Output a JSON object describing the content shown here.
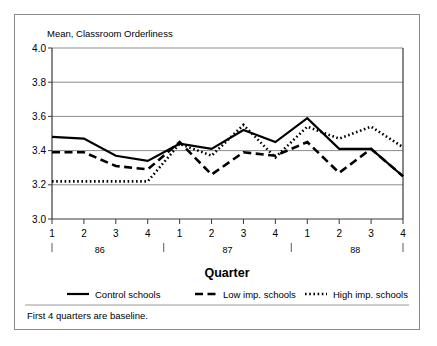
{
  "figure": {
    "plot_title": "Mean, Classroom Orderliness",
    "footnote": "First 4 quarters are baseline."
  },
  "chart_data": {
    "type": "line",
    "title": "Mean, Classroom Orderliness",
    "xlabel": "Quarter",
    "ylabel": "Mean, Classroom Orderliness",
    "ylim": [
      3.0,
      4.0
    ],
    "ytick_labels": [
      "4.0",
      "3.8",
      "3.6",
      "3.4",
      "3.2",
      "3.0"
    ],
    "ytick_values": [
      4.0,
      3.8,
      3.6,
      3.4,
      3.2,
      3.0
    ],
    "grid": true,
    "legend_position": "bottom",
    "categories": [
      "1",
      "2",
      "3",
      "4",
      "1",
      "2",
      "3",
      "4",
      "1",
      "2",
      "3",
      "4"
    ],
    "x_groups": [
      {
        "label": "86",
        "quarters": [
          "1",
          "2",
          "3",
          "4"
        ]
      },
      {
        "label": "87",
        "quarters": [
          "1",
          "2",
          "3",
          "4"
        ]
      },
      {
        "label": "88",
        "quarters": [
          "1",
          "2",
          "3",
          "4"
        ]
      }
    ],
    "annotations": [
      "First 4 quarters are baseline."
    ],
    "series": [
      {
        "name": "Control schools",
        "style": "solid",
        "values": [
          3.48,
          3.47,
          3.37,
          3.34,
          3.44,
          3.41,
          3.52,
          3.45,
          3.59,
          3.41,
          3.41,
          3.25
        ]
      },
      {
        "name": "Low imp. schools",
        "style": "dashed",
        "values": [
          3.39,
          3.39,
          3.31,
          3.29,
          3.45,
          3.26,
          3.39,
          3.37,
          3.45,
          3.27,
          3.41,
          3.25
        ]
      },
      {
        "name": "High imp. schools",
        "style": "dotted",
        "values": [
          3.22,
          3.22,
          3.22,
          3.22,
          3.44,
          3.37,
          3.55,
          3.36,
          3.54,
          3.47,
          3.54,
          3.42
        ]
      }
    ]
  },
  "legend": {
    "items": [
      {
        "label": "Control schools",
        "style": "solid"
      },
      {
        "label": "Low imp. schools",
        "style": "dashed"
      },
      {
        "label": "High imp. schools",
        "style": "dotted"
      }
    ]
  }
}
